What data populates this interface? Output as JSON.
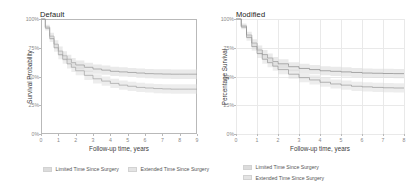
{
  "figure": {
    "background": "#ffffff",
    "panels": [
      "Default",
      "Modified"
    ]
  },
  "chart_data": [
    {
      "type": "line",
      "title": "Default",
      "xlabel": "Follow-up time, years",
      "ylabel": "Survival Probability",
      "xlim": [
        0,
        9
      ],
      "ylim": [
        0,
        100
      ],
      "xticks": [
        0,
        1,
        2,
        3,
        4,
        5,
        6,
        7,
        8,
        9
      ],
      "xtick_labels": [
        "0",
        "1",
        "2",
        "3",
        "4",
        "5",
        "6",
        "7",
        "8",
        "9"
      ],
      "yticks": [
        0,
        25,
        50,
        75,
        100
      ],
      "ytick_labels": [
        "0%",
        "25%",
        "50%",
        "75%",
        "100%"
      ],
      "grid": false,
      "frame": true,
      "legend_position": "bottom-horizontal",
      "band_color": "#d8d8d8",
      "line_color": "#9a9a9a",
      "series": [
        {
          "name": "Limited Time Since Surgery",
          "x": [
            0,
            0.25,
            0.5,
            0.75,
            1,
            1.25,
            1.5,
            1.75,
            2,
            2.5,
            3,
            3.5,
            4,
            4.5,
            5,
            5.5,
            6,
            6.5,
            7,
            7.5,
            8,
            8.5,
            9
          ],
          "values": [
            100,
            93,
            85,
            78,
            72,
            68,
            65,
            62,
            60,
            58,
            56.5,
            55.5,
            54.5,
            54,
            53.5,
            53,
            52.5,
            52.3,
            52.1,
            52,
            52,
            52,
            52
          ],
          "ci_upper": [
            100,
            95,
            88,
            81.5,
            76,
            72,
            69,
            66,
            64,
            62,
            60.5,
            59.5,
            58.5,
            58,
            57.5,
            57,
            56.5,
            56.3,
            56.2,
            56.1,
            56.1,
            56.1,
            56.1
          ],
          "ci_lower": [
            100,
            91,
            82,
            74.5,
            68,
            64,
            61,
            58,
            56,
            54,
            52.5,
            51.5,
            50.5,
            50,
            49.5,
            49,
            48.5,
            48.3,
            48,
            47.9,
            47.9,
            47.9,
            47.9
          ]
        },
        {
          "name": "Extended Time Since Surgery",
          "x": [
            0,
            0.25,
            0.5,
            0.75,
            1,
            1.25,
            1.5,
            1.75,
            2,
            2.5,
            3,
            3.5,
            4,
            4.5,
            5,
            5.5,
            6,
            6.5,
            7,
            7.5,
            8,
            8.5,
            9
          ],
          "values": [
            100,
            92,
            83,
            75,
            69,
            65,
            61,
            58,
            55,
            51,
            48,
            46,
            44,
            42.5,
            41.5,
            40.5,
            40,
            39.5,
            39.2,
            39,
            39,
            39,
            39
          ],
          "ci_upper": [
            100,
            94,
            86,
            78.5,
            73,
            69,
            65,
            62,
            59,
            55,
            52,
            50,
            48,
            46.5,
            45.5,
            44.5,
            44,
            43.5,
            43.3,
            43.2,
            43.2,
            43.2,
            43.2
          ],
          "ci_lower": [
            100,
            90,
            80,
            71.5,
            65,
            61,
            57,
            54,
            51,
            47,
            44,
            42,
            40,
            38.5,
            37.5,
            36.5,
            36,
            35.5,
            35.2,
            35,
            35,
            35,
            35
          ]
        }
      ],
      "legend": [
        "Limited Time Since Surgery",
        "Extended Time Since Surgery"
      ]
    },
    {
      "type": "line",
      "title": "Modified",
      "xlabel": "Follow-up time, years",
      "ylabel": "Percentage Survival",
      "xlim": [
        0,
        8
      ],
      "ylim": [
        0,
        100
      ],
      "xticks": [
        0,
        1,
        2,
        3,
        4,
        5,
        6,
        7,
        8
      ],
      "xtick_labels": [
        "0",
        "1",
        "2",
        "3",
        "4",
        "5",
        "6",
        "7",
        "8"
      ],
      "yticks": [
        0,
        25,
        50,
        75,
        100
      ],
      "ytick_labels": [
        "0%",
        "25%",
        "50%",
        "75%",
        "100%"
      ],
      "grid": true,
      "frame": false,
      "legend_position": "bottom-vertical",
      "band_color": "#d8d8d8",
      "line_color": "#8f8f8f",
      "series": [
        {
          "name": "Limited Time Since Surgery",
          "x": [
            0,
            0.25,
            0.5,
            0.75,
            1,
            1.25,
            1.5,
            1.75,
            2,
            2.5,
            3,
            3.5,
            4,
            4.5,
            5,
            5.5,
            6,
            6.5,
            7,
            7.5,
            8
          ],
          "values": [
            100,
            94,
            86,
            79,
            73,
            69,
            66,
            63,
            61,
            58.5,
            57,
            56,
            55,
            54.5,
            54,
            53.5,
            53,
            52.8,
            52.6,
            52.5,
            52.5
          ],
          "ci_upper": [
            100,
            96,
            89,
            82.5,
            77,
            73,
            70,
            67,
            65,
            62.5,
            61,
            60,
            59,
            58.5,
            58,
            57.5,
            57,
            56.8,
            56.7,
            56.6,
            56.6
          ],
          "ci_lower": [
            100,
            92,
            83,
            75.5,
            69,
            65,
            62,
            59,
            57,
            54.5,
            53,
            52,
            51,
            50.5,
            50,
            49.5,
            49,
            48.8,
            48.6,
            48.5,
            48.5
          ]
        },
        {
          "name": "Extended Time Since Surgery",
          "x": [
            0,
            0.25,
            0.5,
            0.75,
            1,
            1.25,
            1.5,
            1.75,
            2,
            2.5,
            3,
            3.5,
            4,
            4.5,
            5,
            5.5,
            6,
            6.5,
            7,
            7.5,
            8
          ],
          "values": [
            100,
            93,
            84,
            76,
            70,
            65,
            62,
            59,
            56,
            52,
            49,
            47,
            45,
            43.5,
            42.5,
            41.5,
            41,
            40.5,
            40.2,
            40,
            40
          ],
          "ci_upper": [
            100,
            95,
            87,
            79.5,
            74,
            69,
            66,
            63,
            60,
            56,
            53,
            51,
            49,
            47.5,
            46.5,
            45.5,
            45,
            44.5,
            44.3,
            44.2,
            44.2
          ],
          "ci_lower": [
            100,
            91,
            81,
            72.5,
            66,
            61,
            58,
            55,
            52,
            48,
            45,
            43,
            41,
            39.5,
            38.5,
            37.5,
            37,
            36.5,
            36.2,
            36,
            36
          ]
        }
      ],
      "legend": [
        "Limited Time Since Surgery",
        "Extended Time Since Surgery"
      ]
    }
  ]
}
